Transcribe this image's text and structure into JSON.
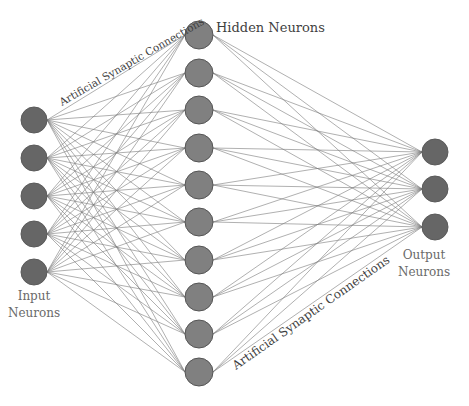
{
  "diagram": {
    "type": "feedforward-neural-network",
    "layers": [
      {
        "name": "input",
        "count": 5,
        "x": 34,
        "ys": [
          120,
          158,
          196,
          234,
          272
        ],
        "r": 13,
        "fill": "#666666",
        "stroke": "#5a5a5a"
      },
      {
        "name": "hidden",
        "count": 10,
        "x": 199,
        "ys": [
          35,
          73,
          110,
          148,
          185,
          222,
          260,
          297,
          334,
          372
        ],
        "r": 14,
        "fill": "#808080",
        "stroke": "#555555"
      },
      {
        "name": "output",
        "count": 3,
        "x": 435,
        "ys": [
          152,
          189,
          227
        ],
        "r": 13,
        "fill": "#666666",
        "stroke": "#5a5a5a"
      }
    ],
    "connections": [
      {
        "from": "input",
        "to": "hidden",
        "pattern": "fully-connected"
      },
      {
        "from": "hidden",
        "to": "output",
        "pattern": "fully-connected"
      }
    ]
  },
  "labels": {
    "hidden": "Hidden Neurons",
    "input_line1": "Input",
    "input_line2": "Neurons",
    "output_line1": "Output",
    "output_line2": "Neurons",
    "connections_upper": "Artificial Synaptic Connections",
    "connections_lower": "Artificial Synaptic Connections"
  }
}
